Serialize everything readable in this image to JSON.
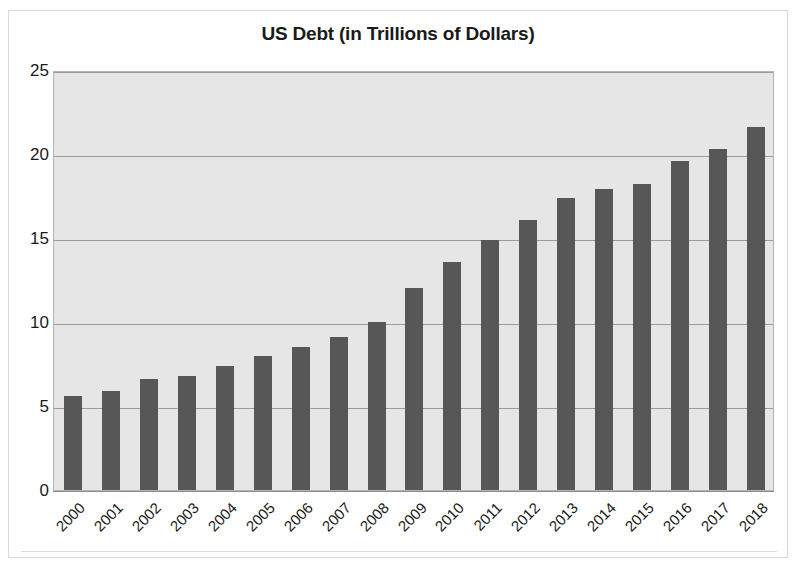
{
  "chart_data": {
    "type": "bar",
    "title": "US Debt (in Trillions of Dollars)",
    "xlabel": "",
    "ylabel": "",
    "ylim": [
      0,
      25
    ],
    "yticks": [
      0,
      5,
      10,
      15,
      20,
      25
    ],
    "grid": true,
    "legend": false,
    "bar_color": "#575757",
    "plot_background": "#e6e6e6",
    "categories": [
      "2000",
      "2001",
      "2002",
      "2003",
      "2004",
      "2005",
      "2006",
      "2007",
      "2008",
      "2009",
      "2010",
      "2011",
      "2012",
      "2013",
      "2014",
      "2015",
      "2016",
      "2017",
      "2018"
    ],
    "values": [
      5.6,
      5.9,
      6.6,
      6.8,
      7.4,
      8.0,
      8.5,
      9.1,
      10.0,
      12.0,
      13.6,
      14.9,
      16.1,
      17.4,
      17.9,
      18.2,
      19.6,
      20.3,
      21.6
    ]
  },
  "frame": {
    "border_color": "#d8d8d8"
  }
}
